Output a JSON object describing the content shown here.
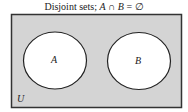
{
  "diagram": {
    "type": "venn",
    "title": {
      "prefix": "Disjoint sets; ",
      "set_a": "A",
      "intersect": " ∩ ",
      "set_b": "B",
      "equals_empty": " = ∅"
    },
    "universe": {
      "label": "U",
      "fill": "#d4d4d4",
      "stroke": "#333333"
    },
    "sets": [
      {
        "label": "A",
        "fill": "#ffffff",
        "stroke": "#222222"
      },
      {
        "label": "B",
        "fill": "#ffffff",
        "stroke": "#222222"
      }
    ],
    "relation": "disjoint"
  }
}
